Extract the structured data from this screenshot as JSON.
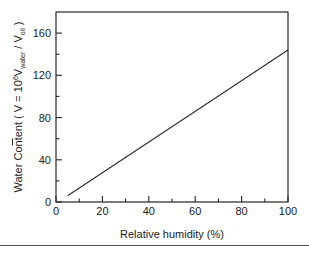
{
  "chart_data": {
    "type": "line",
    "title": "",
    "xlabel": "Relative humidity (%)",
    "ylabel_prefix": "Water Content ( ",
    "ylabel_vbar": "V",
    "ylabel_eq": " = 10",
    "ylabel_exp": "6",
    "ylabel_v2": "V",
    "ylabel_sub_water": "water",
    "ylabel_slash": " / ",
    "ylabel_v3": "V",
    "ylabel_sub_oil": "oil",
    "ylabel_suffix": " )",
    "ylabel_full": "Water Content ( V = 10^6 Vwater / Voil )",
    "xlim": [
      0,
      100
    ],
    "ylim": [
      0,
      180
    ],
    "x_major_ticks": [
      0,
      20,
      40,
      60,
      80,
      100
    ],
    "x_major_tick_labels": [
      "0",
      "20",
      "40",
      "60",
      "80",
      "100"
    ],
    "x_minor_ticks": [
      10,
      30,
      50,
      70,
      90
    ],
    "y_major_ticks": [
      0,
      40,
      80,
      120,
      160
    ],
    "y_major_tick_labels": [
      "0",
      "40",
      "80",
      "120",
      "160"
    ],
    "y_minor_ticks": [
      20,
      60,
      100,
      140
    ],
    "grid": false,
    "legend": false,
    "series": [
      {
        "name": "water content vs relative humidity",
        "x": [
          5,
          100
        ],
        "values": [
          6,
          144
        ],
        "color": "#2b2b2b"
      }
    ],
    "line_color": "#2b2b2b",
    "frame_color": "#262626",
    "background_color": "#ffffff"
  }
}
